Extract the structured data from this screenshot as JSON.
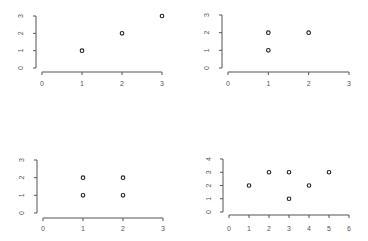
{
  "chart_data": [
    {
      "type": "scatter",
      "panel": "top-left",
      "title": "",
      "xlabel": "",
      "ylabel": "",
      "x": [
        1,
        2,
        3
      ],
      "y": [
        1,
        2,
        3
      ],
      "xlim": [
        0,
        3
      ],
      "ylim": [
        0,
        3
      ],
      "xticks": [
        "0",
        "1",
        "2",
        "3"
      ],
      "yticks": [
        "0",
        "1",
        "2",
        "3"
      ],
      "grid": false,
      "marker": "open-circle"
    },
    {
      "type": "scatter",
      "panel": "top-right",
      "title": "",
      "xlabel": "",
      "ylabel": "",
      "x": [
        1,
        1,
        2
      ],
      "y": [
        1,
        2,
        2
      ],
      "xlim": [
        0,
        3
      ],
      "ylim": [
        0,
        3
      ],
      "xticks": [
        "0",
        "1",
        "2",
        "3"
      ],
      "yticks": [
        "0",
        "1",
        "2",
        "3"
      ],
      "grid": false,
      "marker": "open-circle"
    },
    {
      "type": "scatter",
      "panel": "bottom-left",
      "title": "",
      "xlabel": "",
      "ylabel": "",
      "x": [
        1,
        1,
        2,
        2
      ],
      "y": [
        1,
        2,
        1,
        2
      ],
      "xlim": [
        0,
        3
      ],
      "ylim": [
        0,
        3
      ],
      "xticks": [
        "0",
        "1",
        "2",
        "3"
      ],
      "yticks": [
        "0",
        "1",
        "2",
        "3"
      ],
      "grid": false,
      "marker": "open-circle"
    },
    {
      "type": "scatter",
      "panel": "bottom-right",
      "title": "",
      "xlabel": "",
      "ylabel": "",
      "x": [
        1,
        2,
        3,
        3,
        4,
        5
      ],
      "y": [
        2,
        3,
        1,
        3,
        2,
        3
      ],
      "xlim": [
        0,
        6
      ],
      "ylim": [
        0,
        4
      ],
      "xticks": [
        "0",
        "1",
        "2",
        "3",
        "4",
        "5",
        "6"
      ],
      "yticks": [
        "0",
        "1",
        "2",
        "3",
        "4"
      ],
      "grid": false,
      "marker": "open-circle"
    }
  ],
  "layout": {
    "panels": [
      {
        "x0": 42,
        "x1": 162,
        "xaxis_y": 72,
        "yaxis_x": 36,
        "y0": 68,
        "y1": 16,
        "xlabel_y": 86,
        "ylabel_x": 23
      },
      {
        "x0": 228,
        "x1": 349,
        "xaxis_y": 72,
        "yaxis_x": 222,
        "y0": 68,
        "y1": 15,
        "xlabel_y": 86,
        "ylabel_x": 209
      },
      {
        "x0": 43,
        "x1": 163,
        "xaxis_y": 218,
        "yaxis_x": 37,
        "y0": 213,
        "y1": 160,
        "xlabel_y": 231,
        "ylabel_x": 24
      },
      {
        "x0": 229,
        "x1": 349,
        "xaxis_y": 215,
        "yaxis_x": 223,
        "y0": 212,
        "y1": 159,
        "xlabel_y": 231,
        "ylabel_x": 211
      }
    ],
    "colors": {
      "axis": "#555555",
      "point": "#222222",
      "background": "#ffffff"
    }
  }
}
